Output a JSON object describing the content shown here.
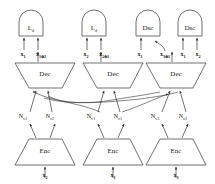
{
  "diagram": {
    "type": "encoder-decoder-gan-architecture",
    "stroke_color": "#333333",
    "background": "#ffffff",
    "top_modules": [
      {
        "id": "ld-1",
        "label": "L",
        "sub": "d",
        "kind": "loss",
        "cx": 31,
        "inputs": [
          "x1",
          "x1+2"
        ]
      },
      {
        "id": "ld-2",
        "label": "L",
        "sub": "d",
        "kind": "loss",
        "cx": 94,
        "inputs": [
          "x2",
          "x2+1"
        ]
      },
      {
        "id": "dsc-1",
        "label": "Dsc",
        "sub": "",
        "kind": "discriminator",
        "cx": 148,
        "inputs": [
          "x1",
          "x3+1"
        ]
      },
      {
        "id": "dsc-2",
        "label": "Dsc",
        "sub": "",
        "kind": "discriminator",
        "cx": 190,
        "inputs": [
          "x1",
          "x2"
        ]
      }
    ],
    "top_input_labels": [
      {
        "text": "x",
        "sub": "1",
        "x": 20,
        "y": 46
      },
      {
        "text": "x",
        "sub": "1⊕2",
        "x": 44,
        "y": 46
      },
      {
        "text": "x",
        "sub": "2",
        "x": 83,
        "y": 46
      },
      {
        "text": "x",
        "sub": "2⊕1",
        "x": 106,
        "y": 46
      },
      {
        "text": "x",
        "sub": "1",
        "x": 139,
        "y": 46
      },
      {
        "text": "x",
        "sub": "3⊕1",
        "x": 162,
        "y": 46
      },
      {
        "text": "x",
        "sub": "1",
        "x": 181,
        "y": 46
      },
      {
        "text": "x",
        "sub": "2",
        "x": 199,
        "y": 46
      }
    ],
    "decoders": [
      {
        "id": "dec-1",
        "label": "Dec",
        "cx": 45
      },
      {
        "id": "dec-2",
        "label": "Dec",
        "cx": 113
      },
      {
        "id": "dec-3",
        "label": "Dec",
        "cx": 176
      }
    ],
    "latent_nodes": [
      {
        "text": "N",
        "sub": "v2",
        "x": 23,
        "y": 118
      },
      {
        "text": "N",
        "sub": "c2",
        "x": 49,
        "y": 118
      },
      {
        "text": "N",
        "sub": "v1",
        "x": 91,
        "y": 118
      },
      {
        "text": "N",
        "sub": "c1",
        "x": 117,
        "y": 118
      },
      {
        "text": "N",
        "sub": "v3",
        "x": 154,
        "y": 118
      },
      {
        "text": "N",
        "sub": "c3",
        "x": 182,
        "y": 118
      }
    ],
    "encoders": [
      {
        "id": "enc-1",
        "label": "Enc",
        "cx": 45,
        "input": "x2"
      },
      {
        "id": "enc-2",
        "label": "Enc",
        "cx": 113,
        "input": "x1"
      },
      {
        "id": "enc-3",
        "label": "Enc",
        "cx": 176,
        "input": "x3"
      }
    ],
    "bottom_input_labels": [
      {
        "text": "x",
        "sub": "2",
        "x": 45,
        "y": 175
      },
      {
        "text": "x",
        "sub": "1",
        "x": 113,
        "y": 175
      },
      {
        "text": "x",
        "sub": "3",
        "x": 176,
        "y": 175
      }
    ]
  }
}
